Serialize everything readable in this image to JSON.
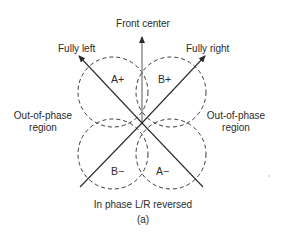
{
  "diagram": {
    "labels": {
      "front_center": "Front center",
      "fully_left": "Fully left",
      "fully_right": "Fully right",
      "out_of_phase_left_line1": "Out-of-phase",
      "out_of_phase_left_line2": "region",
      "out_of_phase_right_line1": "Out-of-phase",
      "out_of_phase_right_line2": "region",
      "bottom": "In phase L/R reversed",
      "caption": "(a)"
    },
    "regions": {
      "a_plus": "A+",
      "b_plus": "B+",
      "b_minus": "B−",
      "a_minus": "A−"
    },
    "colors": {
      "line": "#2a2a2a",
      "dash": "#3a3a3a",
      "background": "#ffffff"
    }
  }
}
